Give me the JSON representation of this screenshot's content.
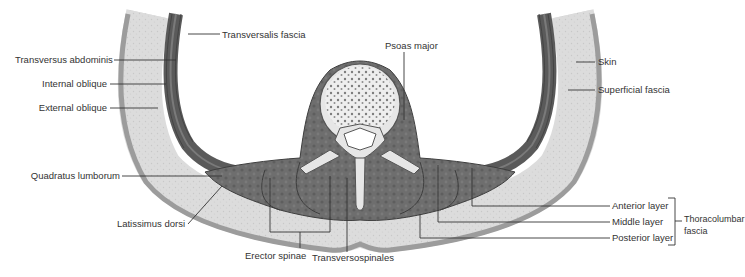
{
  "figure": {
    "colors": {
      "muscle": "#6b6b6b",
      "muscle_dark": "#4f4f4f",
      "fascia_band": "#d9d9d9",
      "skin": "#a8a8a8",
      "bone": "#e8e8e8",
      "leader_line": "#333333"
    },
    "labels": {
      "transversalis_fascia": "Transversalis fascia",
      "transversus_abdominis": "Transversus abdominis",
      "internal_oblique": "Internal oblique",
      "external_oblique": "External oblique",
      "quadratus_lumborum": "Quadratus lumborum",
      "latissimus_dorsi": "Latissimus dorsi",
      "erector_spinae": "Erector spinae",
      "transversospinales": "Transversospinales",
      "psoas_major": "Psoas major",
      "skin": "Skin",
      "superficial_fascia": "Superficial fascia",
      "anterior_layer": "Anterior layer",
      "middle_layer": "Middle layer",
      "posterior_layer": "Posterior layer",
      "thoracolumbar_line1": "Thoracolumbar",
      "thoracolumbar_line2": "fascia"
    }
  }
}
